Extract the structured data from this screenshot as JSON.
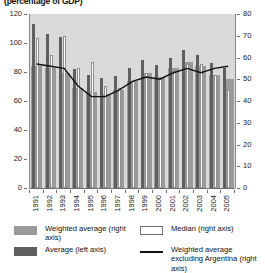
{
  "subtitle": "(percentage of GDP)",
  "legend": {
    "weighted_average": "Weighted average (right axis)",
    "average": "Average (left axis)",
    "median": "Median (right axis)",
    "weighted_average_ex_arg": "Weighted average excluding Argentina (right axis)"
  },
  "colors": {
    "weighted_average": "#9a9a9a",
    "average": "#5f5f5f",
    "median": "#ffffff",
    "line": "#111111",
    "plot_background": "#d9d9d9",
    "axis": "#6d6d6d"
  },
  "chart_data": {
    "type": "bar",
    "title": "(percentage of GDP)",
    "xlabel": "",
    "ylabel": "",
    "grid": false,
    "legend_position": "bottom",
    "categories": [
      "1991",
      "1992",
      "1993",
      "1994",
      "1995",
      "1996",
      "1997",
      "1998",
      "1999",
      "2000",
      "2001",
      "2002",
      "2003",
      "2004",
      "2005"
    ],
    "left_axis": {
      "label": "Average (left axis)",
      "ylim": [
        0,
        120
      ],
      "ticks": [
        0,
        20,
        40,
        60,
        80,
        100,
        120
      ]
    },
    "right_axis": {
      "label": "Weighted average / Median (right axis)",
      "ylim": [
        0,
        80
      ],
      "ticks": [
        0,
        10,
        20,
        30,
        40,
        50,
        60,
        70,
        80
      ]
    },
    "series": [
      {
        "name": "Weighted average (right axis)",
        "axis": "right",
        "kind": "bar",
        "values": [
          56,
          55,
          53,
          46,
          44,
          43,
          45,
          49,
          53,
          51,
          55,
          58,
          56,
          52,
          50
        ]
      },
      {
        "name": "Average (left axis)",
        "axis": "left",
        "kind": "bar",
        "values": [
          113,
          106,
          104,
          82,
          78,
          76,
          77,
          83,
          88,
          85,
          90,
          95,
          92,
          86,
          83
        ]
      },
      {
        "name": "Median (right axis)",
        "axis": "right",
        "kind": "bar",
        "values": [
          69,
          61,
          70,
          55,
          58,
          47,
          46,
          49,
          53,
          50,
          54,
          57,
          57,
          52,
          45
        ]
      },
      {
        "name": "Weighted average excluding Argentina (right axis)",
        "axis": "right",
        "kind": "line",
        "values": [
          57,
          56,
          55,
          47,
          42,
          42,
          45,
          49,
          51,
          50,
          53,
          55,
          53,
          55,
          56
        ]
      }
    ]
  }
}
